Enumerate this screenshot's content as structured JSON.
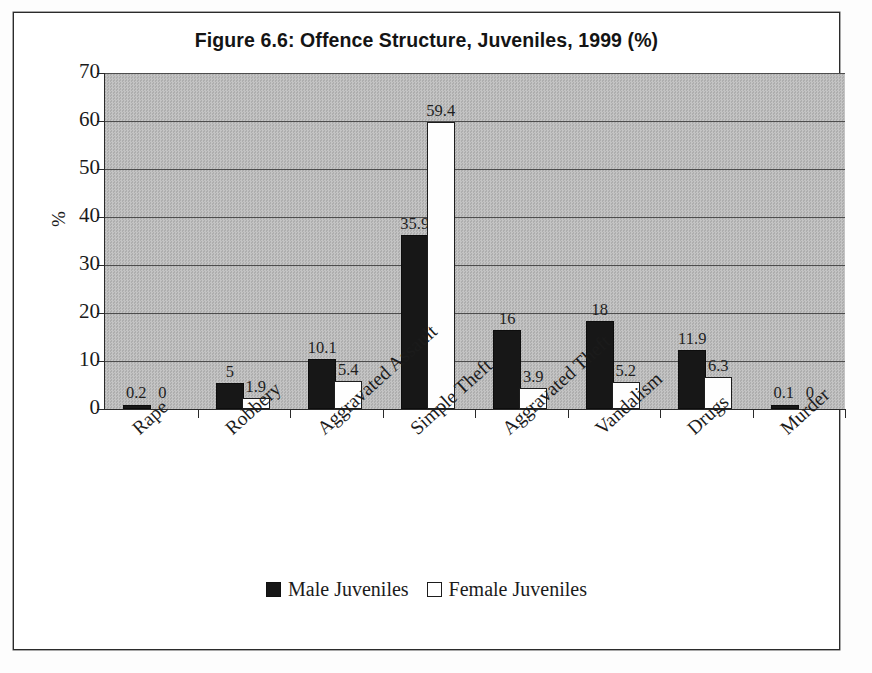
{
  "figure": {
    "title": "Figure 6.6: Offence Structure, Juveniles, 1999 (%)"
  },
  "axes": {
    "y_title": "%",
    "y_ticks": [
      "0",
      "10",
      "20",
      "30",
      "40",
      "50",
      "60",
      "70"
    ]
  },
  "legend": {
    "items": [
      {
        "label": "Male Juveniles",
        "swatch": "filled-black-square"
      },
      {
        "label": "Female Juveniles",
        "swatch": "outlined-white-square"
      }
    ]
  },
  "chart_data": {
    "type": "bar",
    "title": "Figure 6.6: Offence Structure, Juveniles, 1999 (%)",
    "xlabel": "",
    "ylabel": "%",
    "ylim": [
      0,
      70
    ],
    "ytick_step": 10,
    "grid": true,
    "legend_position": "bottom-center",
    "categories": [
      "Rape",
      "Robbery",
      "Aggravated Assault",
      "Simple Theft",
      "Aggravated Theft",
      "Vandalism",
      "Drugs",
      "Murder"
    ],
    "series": [
      {
        "name": "Male Juveniles",
        "color": "#171717",
        "values": [
          0.2,
          5,
          10.1,
          35.9,
          16,
          18,
          11.9,
          0.1
        ],
        "labels": [
          "0.2",
          "5",
          "10.1",
          "35.9",
          "16",
          "18",
          "11.9",
          "0.1"
        ]
      },
      {
        "name": "Female Juveniles",
        "color": "#ffffff",
        "values": [
          0,
          1.9,
          5.4,
          59.4,
          3.9,
          5.2,
          6.3,
          0
        ],
        "labels": [
          "0",
          "1.9",
          "5.4",
          "59.4",
          "3.9",
          "5.2",
          "6.3",
          "0"
        ]
      }
    ]
  },
  "style": {
    "plot_background": "#b9b9b9",
    "axis_color": "#2a2a2a",
    "male_color": "#171717",
    "female_color": "#ffffff"
  }
}
